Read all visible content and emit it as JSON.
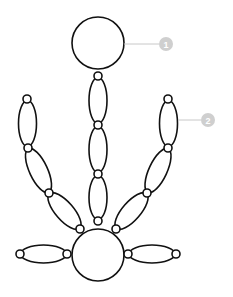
{
  "diagram": {
    "type": "chain-of-loops",
    "colors": {
      "stroke": "#111111",
      "fill": "#ffffff",
      "callout": "#c8c8c8",
      "badge": "#cfcfcf"
    },
    "callouts": [
      {
        "label": "1",
        "target": "top-ring"
      },
      {
        "label": "2",
        "target": "right-arm-upper-loop"
      }
    ]
  }
}
